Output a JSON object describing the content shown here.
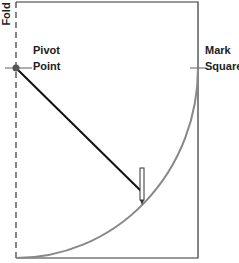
{
  "diagram": {
    "labels": {
      "fold": "Fold",
      "pivot_line1": "Pivot",
      "pivot_line2": "Point",
      "mark_line1": "Mark",
      "mark_line2": "Square"
    },
    "colors": {
      "outline": "#333333",
      "arc": "#888888",
      "radius_line": "#111111",
      "pivot_dot": "#555555"
    }
  }
}
